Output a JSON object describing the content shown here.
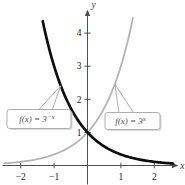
{
  "figure": {
    "background": "#ffffff"
  },
  "chart_data": {
    "type": "line",
    "title": "",
    "x_axis": {
      "label": "x",
      "range": [
        -2.53,
        2.72
      ],
      "ticks": [
        -2,
        -1,
        1,
        2
      ],
      "tick_labels": [
        "−2",
        "−1",
        "1",
        "2"
      ]
    },
    "y_axis": {
      "label": "y",
      "range": [
        0,
        4.7
      ],
      "ticks": [
        1,
        2,
        3,
        4
      ],
      "tick_labels": [
        "1",
        "2",
        "3",
        "4"
      ]
    },
    "grid": false,
    "legend_position": "callouts-on-plot",
    "series": [
      {
        "id": "f-of-x-3-to-neg-x",
        "name": "f(x) = 3^(−x)",
        "expression": "y = 3^(−x)",
        "base": 3,
        "exp_sign": -1,
        "x_domain": [
          -1.34,
          2.56
        ],
        "key_points": [
          [
            -2,
            9
          ],
          [
            -1,
            3
          ],
          [
            0,
            1
          ],
          [
            1,
            0.333
          ],
          [
            2,
            0.111
          ]
        ],
        "color": "#0d0d0d",
        "stroke_width": 2.7,
        "z_order": 2
      },
      {
        "id": "f-of-x-3-to-x",
        "name": "f(x) = 3^x",
        "expression": "y = 3^x",
        "base": 3,
        "exp_sign": 1,
        "x_domain": [
          -2.5,
          1.36
        ],
        "key_points": [
          [
            -2,
            0.111
          ],
          [
            -1,
            0.333
          ],
          [
            0,
            1
          ],
          [
            1,
            3
          ],
          [
            2,
            9
          ]
        ],
        "color": "#b4b4b4",
        "stroke_width": 1.8,
        "z_order": 1
      }
    ],
    "annotations": [
      {
        "id": "callout-f-3-neg-x",
        "text_main": "f(x) = 3",
        "text_sup": "−x",
        "tip": [
          -0.8,
          2.41
        ],
        "box": {
          "x": 7,
          "y": 109.5,
          "w": 64,
          "h": 19
        },
        "tail_base": [
          38,
          52
        ]
      },
      {
        "id": "callout-f-3-x",
        "text_main": "f(x) = 3",
        "text_sup": "x",
        "tip": [
          0.82,
          2.46
        ],
        "box": {
          "x": 105,
          "y": 112.5,
          "w": 55,
          "h": 17
        },
        "tail_base": [
          119,
          134
        ]
      }
    ],
    "styles": {
      "axis_color": "#4f4f4f",
      "tick_label_color": "#1a1a1a",
      "axis_letter_color": "#333333",
      "annotation_text_color": "#4f4f4f",
      "annotation_border_color": "#aeaeae",
      "annotation_fill": "#ffffff",
      "annotation_shadow": "#d9d9d9"
    },
    "layout_hints": {
      "x0_px": 87.5,
      "y0_px": 165.5,
      "x_unit_px": 33.4,
      "y_unit_px": 33.1,
      "width": 185,
      "height": 185,
      "x_tick_label_baseline_px": 179.5,
      "y_axis_top_px": 9.5,
      "y_axis_bottom_px": 184.5,
      "x_axis_left_px": 2.5
    }
  }
}
